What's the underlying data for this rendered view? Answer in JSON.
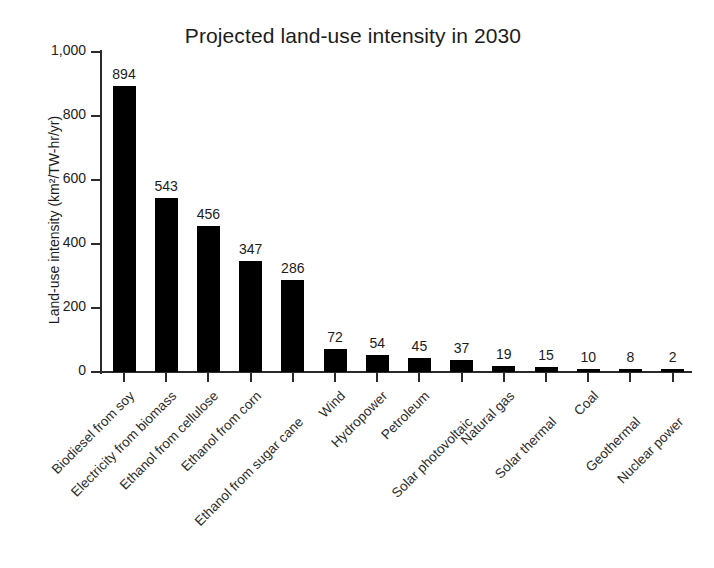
{
  "chart_data": {
    "type": "bar",
    "title": "Projected land-use intensity in 2030",
    "xlabel": "",
    "ylabel": "Land-use intensity (km²/TW-hr/yr)",
    "ylim": [
      0,
      1000
    ],
    "yticks": [
      0,
      200,
      400,
      600,
      800,
      1000
    ],
    "ytick_labels": [
      "0",
      "200",
      "400",
      "600",
      "800",
      "1,000"
    ],
    "grid": false,
    "legend": false,
    "bar_color": "#000000",
    "categories": [
      "Biodiesel from soy",
      "Electricity from biomass",
      "Ethanol from cellulose",
      "Ethanol from corn",
      "Ethanol from sugar cane",
      "Wind",
      "Hydropower",
      "Petroleum",
      "Solar photovoltaic",
      "Natural gas",
      "Solar thermal",
      "Coal",
      "Geothermal",
      "Nuclear power"
    ],
    "values": [
      894,
      543,
      456,
      347,
      286,
      72,
      54,
      45,
      37,
      19,
      15,
      10,
      8,
      2
    ],
    "value_labels": [
      "894",
      "543",
      "456",
      "347",
      "286",
      "72",
      "54",
      "45",
      "37",
      "19",
      "15",
      "10",
      "8",
      "2"
    ],
    "label_stagger": [
      0,
      0,
      0,
      0,
      1,
      0,
      0,
      0,
      1,
      0,
      1,
      0,
      1,
      1
    ]
  }
}
